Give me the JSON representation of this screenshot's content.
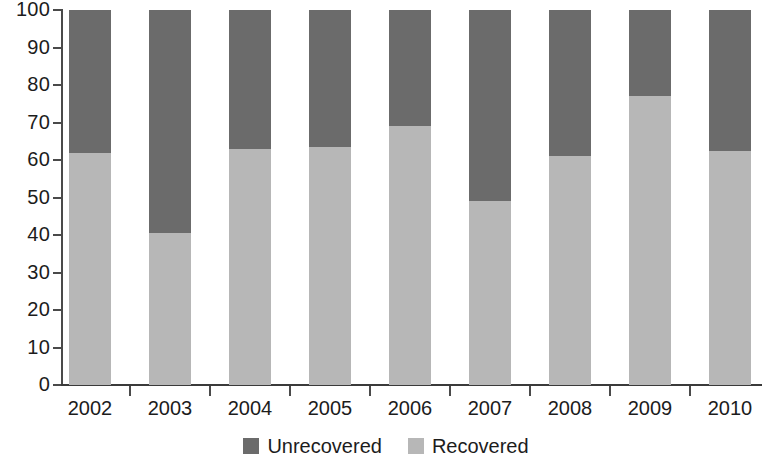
{
  "chart_data": {
    "type": "bar",
    "subtype": "stacked-100-percent",
    "title": "",
    "subtitle": "",
    "xlabel": "",
    "ylabel": "",
    "categories": [
      "2002",
      "2003",
      "2004",
      "2005",
      "2006",
      "2007",
      "2008",
      "2009",
      "2010"
    ],
    "series": [
      {
        "name": "Recovered",
        "color": "#b7b7b7",
        "values": [
          62,
          40.5,
          63,
          63.5,
          69,
          49,
          61,
          77,
          62.5
        ]
      },
      {
        "name": "Unrecovered",
        "color": "#6b6b6b",
        "values": [
          38,
          59.5,
          37,
          36.5,
          31,
          51,
          39,
          23,
          37.5
        ]
      }
    ],
    "stack_order_top_to_bottom": [
      "Unrecovered",
      "Recovered"
    ],
    "ylim": [
      0,
      100
    ],
    "yticks": [
      0,
      10,
      20,
      30,
      40,
      50,
      60,
      70,
      80,
      90,
      100
    ],
    "ytick_labels": [
      "0",
      "10",
      "20",
      "30",
      "40",
      "50",
      "60",
      "70",
      "80",
      "90",
      "100"
    ],
    "grid": false,
    "legend_position": "bottom",
    "legend_entries": [
      {
        "label": "Unrecovered",
        "color": "#6b6b6b"
      },
      {
        "label": "Recovered",
        "color": "#b7b7b7"
      }
    ]
  },
  "axis": {
    "y": {
      "labels": [
        "100",
        "90",
        "80",
        "70",
        "60",
        "50",
        "40",
        "30",
        "20",
        "10",
        "0"
      ]
    },
    "x": {
      "labels": [
        "2002",
        "2003",
        "2004",
        "2005",
        "2006",
        "2007",
        "2008",
        "2009",
        "2010"
      ]
    }
  },
  "legend": {
    "items": [
      {
        "label": "Unrecovered",
        "color": "#6b6b6b"
      },
      {
        "label": "Recovered",
        "color": "#b7b7b7"
      }
    ]
  },
  "colors": {
    "unrecovered": "#6b6b6b",
    "recovered": "#b7b7b7",
    "axis": "#4a4a4a",
    "text": "#1c1c1c",
    "background": "#ffffff"
  }
}
